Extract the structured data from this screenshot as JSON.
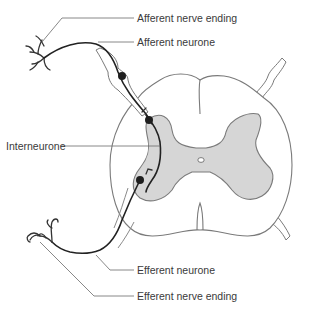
{
  "diagram": {
    "labels": {
      "afferent_nerve_ending": "Afferent nerve ending",
      "afferent_neurone": "Afferent neurone",
      "interneurone": "Interneurone",
      "efferent_neurone": "Efferent neurone",
      "efferent_nerve_ending": "Efferent nerve ending"
    },
    "colors": {
      "grey_matter": "#d6d6d6",
      "outline": "#7a7a7a",
      "nerve": "#222222",
      "label_text": "#3a3a3a"
    }
  }
}
